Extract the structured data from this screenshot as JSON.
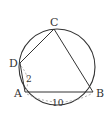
{
  "diagram": {
    "type": "cyclic-quadrilateral",
    "circle": {
      "cx": 57,
      "cy": 67,
      "r": 38
    },
    "points": {
      "A": {
        "label": "A",
        "x": 25,
        "y": 92
      },
      "B": {
        "label": "B",
        "x": 93,
        "y": 92
      },
      "C": {
        "label": "C",
        "x": 54,
        "y": 29
      },
      "D": {
        "label": "D",
        "x": 20,
        "y": 63
      }
    },
    "measurements": {
      "AD": "2",
      "AB": "10"
    },
    "stroke_color": "#333333",
    "dashed_color": "#999999"
  }
}
